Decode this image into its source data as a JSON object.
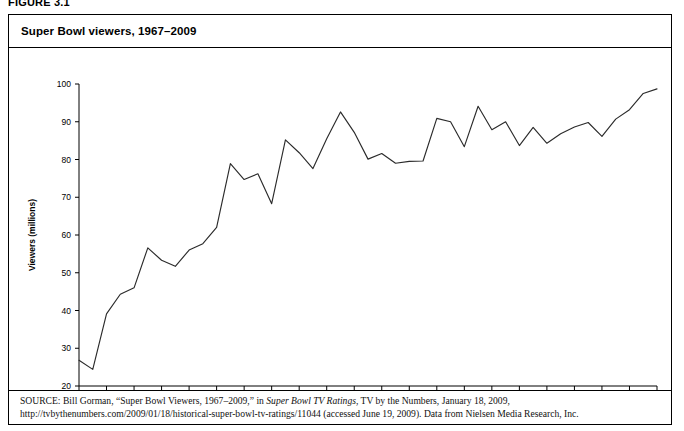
{
  "figure": {
    "label": "FIGURE 3.1",
    "title": "Super Bowl viewers, 1967–2009"
  },
  "source": {
    "keyword": "SOURCE:",
    "part1": " Bill Gorman, “Super Bowl Viewers, 1967–2009,” in ",
    "italic1": "Super Bowl TV Ratings",
    "part2": ", TV by the Numbers, January 18, 2009, http://tvbythenumbers.com/2009/01/18/historical-super-bowl-tv-ratings/11044 (accessed June 19, 2009). Data from Nielsen Media Research, Inc."
  },
  "chart_data": {
    "type": "line",
    "title": "Super Bowl viewers, 1967–2009",
    "xlabel": "",
    "ylabel": "Viewers (millions)",
    "xlim": [
      1967,
      2009
    ],
    "ylim": [
      20,
      100
    ],
    "yticks": [
      20,
      30,
      40,
      50,
      60,
      70,
      80,
      90,
      100
    ],
    "xticks": [
      1967,
      1969,
      1971,
      1973,
      1975,
      1977,
      1979,
      1981,
      1983,
      1985,
      1987,
      1989,
      1991,
      1993,
      1995,
      1997,
      1999,
      2001,
      2003,
      2005,
      2007,
      2009
    ],
    "grid": false,
    "legend": false,
    "line_color": "#2b2b2b",
    "x": [
      1967,
      1968,
      1969,
      1970,
      1971,
      1972,
      1973,
      1974,
      1975,
      1976,
      1977,
      1978,
      1979,
      1980,
      1981,
      1982,
      1983,
      1984,
      1985,
      1986,
      1987,
      1988,
      1989,
      1990,
      1991,
      1992,
      1993,
      1994,
      1995,
      1996,
      1997,
      1998,
      1999,
      2000,
      2001,
      2002,
      2003,
      2004,
      2005,
      2006,
      2007,
      2008,
      2009
    ],
    "values": [
      26.8,
      24.4,
      39.1,
      44.3,
      46.0,
      56.6,
      53.3,
      51.7,
      56.0,
      57.7,
      62.0,
      78.9,
      74.7,
      76.2,
      68.3,
      85.2,
      81.8,
      77.6,
      85.5,
      92.6,
      87.2,
      80.1,
      81.6,
      79.0,
      79.5,
      79.6,
      90.9,
      90.0,
      83.4,
      94.1,
      87.9,
      90.0,
      83.7,
      88.5,
      84.3,
      86.8,
      88.6,
      89.8,
      86.1,
      90.7,
      93.2,
      97.5,
      98.7
    ]
  }
}
